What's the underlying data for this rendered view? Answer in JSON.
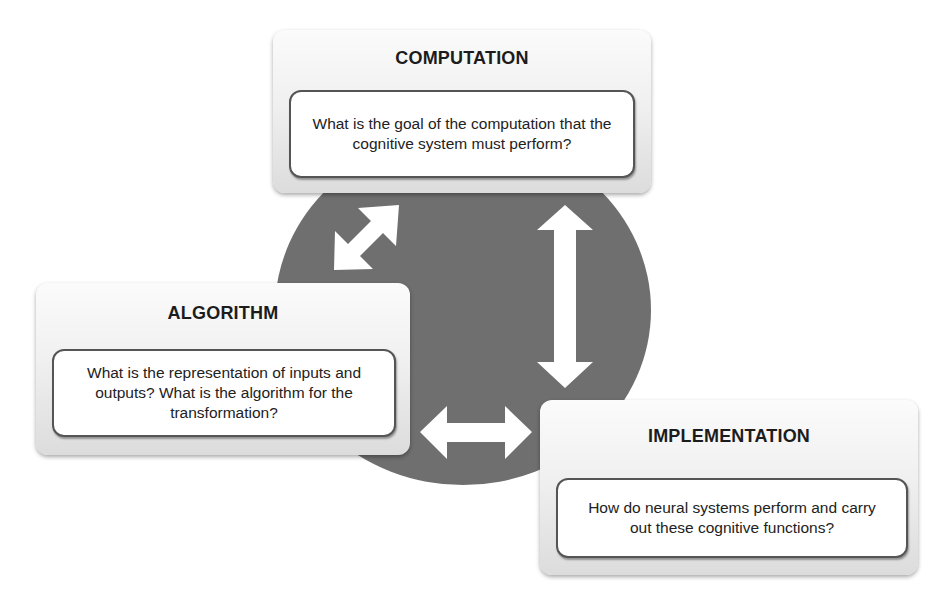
{
  "diagram": {
    "center_circle_color": "#6f6f6f",
    "levels": [
      {
        "id": "computation",
        "title": "COMPUTATION",
        "question": "What is the goal of the computation that the cognitive system must perform?"
      },
      {
        "id": "algorithm",
        "title": "ALGORITHM",
        "question": "What is the representation of inputs and outputs? What is the algorithm for the transformation?"
      },
      {
        "id": "implementation",
        "title": "IMPLEMENTATION",
        "question": "How do neural systems perform and carry out these cognitive functions?"
      }
    ],
    "connections": [
      {
        "from": "computation",
        "to": "algorithm",
        "type": "bidirectional-arrow"
      },
      {
        "from": "computation",
        "to": "implementation",
        "type": "bidirectional-arrow"
      },
      {
        "from": "algorithm",
        "to": "implementation",
        "type": "bidirectional-arrow"
      }
    ]
  }
}
